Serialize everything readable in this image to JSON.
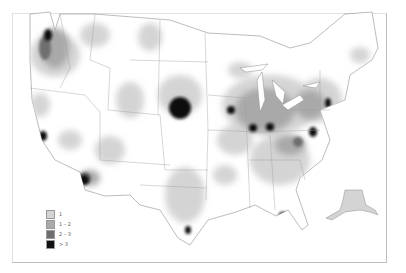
{
  "map": {
    "type": "choropleth-density",
    "region": "United States (contiguous + Alaska inset)",
    "colors": {
      "background": "#ffffff",
      "boundary": "#9a9a9a",
      "level_1": "#d4d4d4",
      "level_2": "#a9a9a9",
      "level_3": "#6e6e6e",
      "level_4": "#111111"
    },
    "hotspots": [
      {
        "name": "seattle-area",
        "level": 4
      },
      {
        "name": "portland-area",
        "level": 3
      },
      {
        "name": "san-francisco-area",
        "level": 4
      },
      {
        "name": "phoenix-area",
        "level": 4
      },
      {
        "name": "south-dakota-nebraska",
        "level": 4
      },
      {
        "name": "chicago-area",
        "level": 4
      },
      {
        "name": "st-louis-area",
        "level": 4
      },
      {
        "name": "indianapolis-area",
        "level": 4
      },
      {
        "name": "ohio-area",
        "level": 4
      },
      {
        "name": "pennsylvania-area",
        "level": 4
      },
      {
        "name": "san-antonio-area",
        "level": 4
      },
      {
        "name": "florida-panhandle",
        "level": 4
      },
      {
        "name": "kentucky-area",
        "level": 3
      }
    ]
  },
  "legend": {
    "items": [
      {
        "label": "1",
        "color": "#d4d4d4"
      },
      {
        "label": "1 – 2",
        "color": "#a9a9a9"
      },
      {
        "label": "2 – 3",
        "color": "#6e6e6e"
      },
      {
        "label": "> 3",
        "color": "#111111"
      }
    ]
  }
}
